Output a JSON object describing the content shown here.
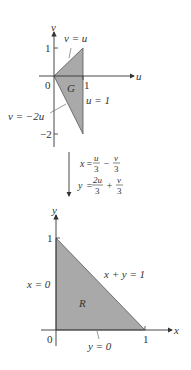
{
  "top_plot": {
    "region_label": "G",
    "axis_x_label": "u",
    "axis_y_label": "v",
    "origin_label": "0",
    "tick_x_1": "1",
    "tick_y_1": "1",
    "tick_y_neg2": "−2",
    "line_upper": "v = u",
    "line_lower": "v = −2u",
    "line_right": "u = 1",
    "fill_color": "#a9a9a9",
    "vertices": [
      [
        0,
        0
      ],
      [
        1,
        1
      ],
      [
        1,
        -2
      ]
    ]
  },
  "transform": {
    "eq_x_lhs": "x",
    "eq_x_t1_num": "u",
    "eq_x_t1_den": "3",
    "eq_x_op": "−",
    "eq_x_t2_num": "v",
    "eq_x_t2_den": "3",
    "eq_y_lhs": "y",
    "eq_y_t1_num": "2u",
    "eq_y_t1_den": "3",
    "eq_y_op": "+",
    "eq_y_t2_num": "v",
    "eq_y_t2_den": "3"
  },
  "bottom_plot": {
    "region_label": "R",
    "axis_x_label": "x",
    "axis_y_label": "y",
    "origin_label": "0",
    "tick_x_1": "1",
    "tick_y_1": "1",
    "line_left": "x = 0",
    "line_bottom": "y = 0",
    "line_hyp": "x + y = 1",
    "fill_color": "#a9a9a9",
    "vertices": [
      [
        0,
        0
      ],
      [
        1,
        0
      ],
      [
        0,
        1
      ]
    ]
  }
}
